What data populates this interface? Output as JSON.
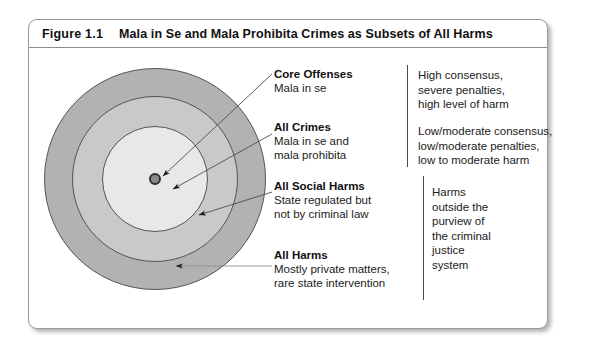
{
  "figure": {
    "number": "Figure 1.1",
    "title": "Mala in Se and Mala Prohibita Crimes as Subsets of All Harms"
  },
  "diagram": {
    "type": "concentric-venn",
    "rings": [
      {
        "name": "core-offenses",
        "label": "Core Offenses",
        "fill": "#6e6e6e"
      },
      {
        "name": "all-crimes",
        "label": "All Crimes",
        "fill": "#e8e8e8"
      },
      {
        "name": "all-social-harms",
        "label": "All Social Harms",
        "fill": "#c9c9c9"
      },
      {
        "name": "all-harms",
        "label": "All Harms",
        "fill": "#b2b2b2"
      }
    ]
  },
  "labels": {
    "core_offenses": {
      "title": "Core Offenses",
      "line1": "Mala in se"
    },
    "all_crimes": {
      "title": "All Crimes",
      "line1": "Mala in se and",
      "line2": "mala prohibita"
    },
    "all_social_harms": {
      "title": "All Social Harms",
      "line1": "State regulated but",
      "line2": "not by criminal law"
    },
    "all_harms": {
      "title": "All Harms",
      "line1": "Mostly private matters,",
      "line2": "rare state intervention"
    }
  },
  "descriptions": {
    "core_offenses": {
      "line1": "High consensus,",
      "line2": "severe penalties,",
      "line3": "high level of harm"
    },
    "all_crimes": {
      "line1": "Low/moderate consensus,",
      "line2": "low/moderate penalties,",
      "line3": "low to moderate harm"
    },
    "all_harms": {
      "line1": "Harms",
      "line2": "outside the",
      "line3": "purview of",
      "line4": "the criminal",
      "line5": "justice",
      "line6": "system"
    }
  }
}
